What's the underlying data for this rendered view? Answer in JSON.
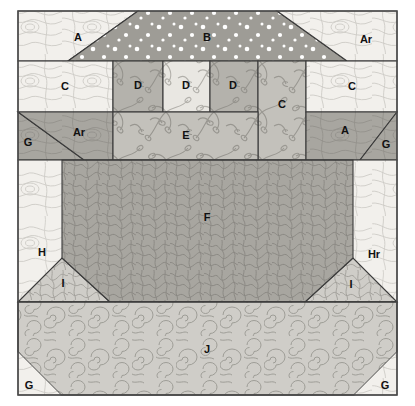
{
  "canvas": {
    "width": 415,
    "height": 406,
    "background": "#ffffff"
  },
  "frame": {
    "x": 18,
    "y": 11,
    "width": 379,
    "height": 384,
    "border_color": "#4a4a4a",
    "seam_color": "#3a3a3a"
  },
  "palette": {
    "very_light_cream": "#f2f0ec",
    "light_cream": "#e9e7e2",
    "pale_gray": "#dddbd6",
    "light_gray": "#cfcdc8",
    "mid_light_gray": "#c3c1bb",
    "mid_gray": "#b4b2ac",
    "medium_gray": "#a8a6a0",
    "dot_gray": "#9e9c96",
    "dark_gray": "#9a9892",
    "texture_line": "#8d8b85",
    "dot_white": "#ffffff",
    "label_ink": "#111111"
  },
  "rows": [
    {
      "name": "row-top",
      "y_top": 11,
      "y_bottom": 61
    },
    {
      "name": "row-c-d",
      "y_top": 61,
      "y_bottom": 112
    },
    {
      "name": "row-ar-e-a",
      "y_top": 112,
      "y_bottom": 160
    },
    {
      "name": "row-f",
      "y_top": 160,
      "y_bottom": 302
    },
    {
      "name": "row-j",
      "y_top": 302,
      "y_bottom": 395
    }
  ],
  "regions": [
    {
      "id": "A-top-left",
      "label": "A",
      "fill": "very_light_cream",
      "texture": "contour",
      "label_x": 78,
      "label_y": 38
    },
    {
      "id": "B-top-center",
      "label": "B",
      "fill": "dot_gray",
      "texture": "dots",
      "label_x": 207,
      "label_y": 38
    },
    {
      "id": "Ar-top-right",
      "label": "Ar",
      "fill": "very_light_cream",
      "texture": "contour",
      "label_x": 366,
      "label_y": 40
    },
    {
      "id": "C-left",
      "label": "C",
      "fill": "very_light_cream",
      "texture": "contour",
      "label_x": 65,
      "label_y": 87
    },
    {
      "id": "D-one",
      "label": "D",
      "fill": "mid_gray",
      "texture": "sprigs",
      "label_x": 138,
      "label_y": 86
    },
    {
      "id": "D-two",
      "label": "D",
      "fill": "light_cream",
      "texture": "sprigs",
      "label_x": 186,
      "label_y": 86
    },
    {
      "id": "D-three",
      "label": "D",
      "fill": "mid_gray",
      "texture": "sprigs",
      "label_x": 233,
      "label_y": 86
    },
    {
      "id": "C-center",
      "label": "C",
      "fill": "mid_light_gray",
      "texture": "sprigs",
      "label_x": 282,
      "label_y": 105
    },
    {
      "id": "C-right",
      "label": "C",
      "fill": "very_light_cream",
      "texture": "contour",
      "label_x": 352,
      "label_y": 87
    },
    {
      "id": "G-mid-left",
      "label": "G",
      "fill": "medium_gray",
      "texture": "contour",
      "label_x": 28,
      "label_y": 143
    },
    {
      "id": "Ar-mid-left",
      "label": "Ar",
      "fill": "medium_gray",
      "texture": "contour",
      "label_x": 79,
      "label_y": 133
    },
    {
      "id": "E-center",
      "label": "E",
      "fill": "mid_light_gray",
      "texture": "sprigs",
      "label_x": 186,
      "label_y": 136
    },
    {
      "id": "A-mid-right",
      "label": "A",
      "fill": "medium_gray",
      "texture": "contour",
      "label_x": 345,
      "label_y": 131
    },
    {
      "id": "G-mid-right",
      "label": "G",
      "fill": "medium_gray",
      "texture": "contour",
      "label_x": 386,
      "label_y": 145
    },
    {
      "id": "F-center",
      "label": "F",
      "fill": "medium_gray",
      "texture": "maze",
      "label_x": 207,
      "label_y": 218
    },
    {
      "id": "H-left",
      "label": "H",
      "fill": "very_light_cream",
      "texture": "contour",
      "label_x": 42,
      "label_y": 253
    },
    {
      "id": "I-left",
      "label": "I",
      "fill": "light_gray",
      "texture": "maze",
      "label_x": 63,
      "label_y": 284
    },
    {
      "id": "Hr-right",
      "label": "Hr",
      "fill": "very_light_cream",
      "texture": "contour",
      "label_x": 374,
      "label_y": 255
    },
    {
      "id": "I-right",
      "label": "I",
      "fill": "light_gray",
      "texture": "maze",
      "label_x": 351,
      "label_y": 285
    },
    {
      "id": "J-bottom",
      "label": "J",
      "fill": "light_gray",
      "texture": "swirl",
      "label_x": 207,
      "label_y": 350
    },
    {
      "id": "G-bottom-left",
      "label": "G",
      "fill": "very_light_cream",
      "texture": "contour",
      "label_x": 29,
      "label_y": 386
    },
    {
      "id": "G-bottom-right",
      "label": "G",
      "fill": "very_light_cream",
      "texture": "contour",
      "label_x": 385,
      "label_y": 386
    }
  ],
  "legend_note": "Quilt block layout diagram with lettered patch regions"
}
